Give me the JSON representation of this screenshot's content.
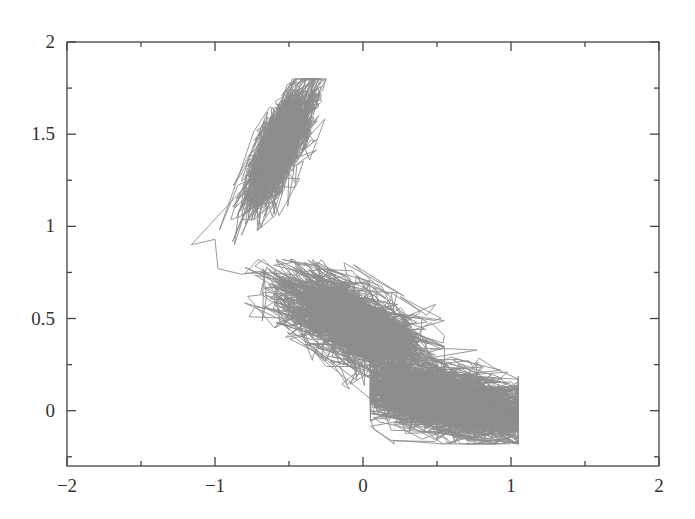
{
  "chart_data": {
    "type": "line",
    "title": "",
    "xlabel": "",
    "ylabel": "",
    "xlim": [
      -2,
      2
    ],
    "ylim": [
      -0.3,
      2
    ],
    "x_ticks": [
      -2,
      -1,
      0,
      1,
      2
    ],
    "x_tick_labels": [
      "−2",
      "−1",
      "0",
      "1",
      "2"
    ],
    "x_minor_ticks": [
      -1.5,
      -0.5,
      0.5,
      1.5
    ],
    "y_ticks": [
      0,
      0.5,
      1,
      1.5,
      2
    ],
    "y_tick_labels": [
      "0",
      "0.5",
      "1",
      "1.5",
      "2"
    ],
    "y_minor_ticks": [
      -0.25,
      0.25,
      0.75,
      1.25,
      1.75
    ],
    "grid": false,
    "legend": null,
    "ticks_inward": true,
    "mirror_ticks": true,
    "line_color": "#8c8c8c",
    "series": [
      {
        "name": "trajectory",
        "description": "2D stochastic trajectory sampling three basins (Muller-Brown-like potential)",
        "basins": [
          {
            "center": [
              -0.56,
              1.44
            ],
            "spread": [
              0.16,
              0.06
            ],
            "angle_deg": 58,
            "steps": 2600,
            "x_range": [
              -1.15,
              -0.25
            ],
            "y_range": [
              0.9,
              1.8
            ]
          },
          {
            "center": [
              -0.05,
              0.46
            ],
            "spread": [
              0.24,
              0.09
            ],
            "angle_deg": -22,
            "steps": 1400,
            "x_range": [
              -0.8,
              0.55
            ],
            "y_range": [
              0.05,
              0.82
            ]
          },
          {
            "center": [
              0.58,
              0.05
            ],
            "spread": [
              0.26,
              0.075
            ],
            "angle_deg": -8,
            "steps": 2600,
            "x_range": [
              0.05,
              1.05
            ],
            "y_range": [
              -0.18,
              0.45
            ]
          }
        ],
        "transition_path": [
          [
            -1.16,
            0.9
          ],
          [
            -1.0,
            0.93
          ],
          [
            -0.98,
            0.77
          ],
          [
            -0.82,
            0.74
          ],
          [
            -0.66,
            0.76
          ],
          [
            -0.68,
            0.63
          ],
          [
            -0.78,
            0.62
          ],
          [
            -0.6,
            0.45
          ],
          [
            -0.45,
            0.55
          ],
          [
            -0.3,
            0.5
          ]
        ]
      }
    ]
  }
}
